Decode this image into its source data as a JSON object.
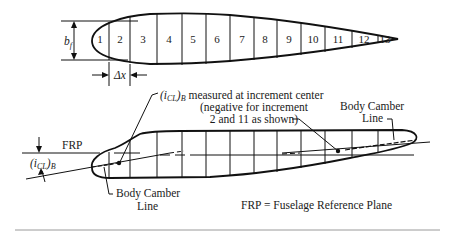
{
  "plan_view": {
    "segments": [
      "1",
      "2",
      "3",
      "4",
      "5",
      "6",
      "7",
      "8",
      "9",
      "10",
      "11",
      "12",
      "13"
    ],
    "width_symbol": "b",
    "width_subscript": "f",
    "increment_symbol": "Δx"
  },
  "side_view": {
    "annotation_line1_sym": "(i",
    "annotation_line1_sub": "CL",
    "annotation_line1_close": ")",
    "annotation_line1_sub2": "B",
    "annotation_line1_rest": " measured at increment center",
    "annotation_line2": "(negative for increment",
    "annotation_line3": "2 and 11 as shown)",
    "frp_label": "FRP",
    "angle_sym": "(i",
    "angle_sub": "CL",
    "angle_close": ")",
    "angle_sub2": "B",
    "camber_left_line1": "Body Camber",
    "camber_left_line2": "Line",
    "camber_right_line1": "Body Camber",
    "camber_right_line2": "Line",
    "legend": "FRP = Fuselage Reference Plane"
  },
  "colors": {
    "ink": "#111111",
    "background": "#ffffff",
    "rule": "#9a9a9a"
  }
}
